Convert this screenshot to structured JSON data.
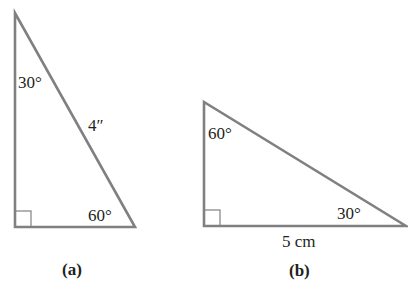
{
  "figures": [
    {
      "caption": "(a)",
      "shape": "right-triangle",
      "angles": {
        "top": "30°",
        "bottom_right": "60°",
        "bottom_left": "right angle"
      },
      "sides": {
        "hypotenuse": "4″"
      }
    },
    {
      "caption": "(b)",
      "shape": "right-triangle",
      "angles": {
        "top": "60°",
        "bottom_right": "30°",
        "bottom_left": "right angle"
      },
      "sides": {
        "base": "5 cm"
      }
    }
  ],
  "colors": {
    "line": "#808080",
    "text": "#231f20"
  }
}
